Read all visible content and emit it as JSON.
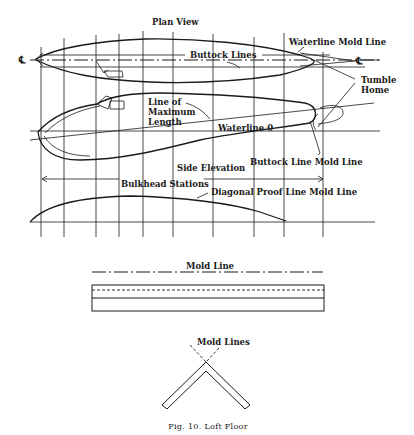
{
  "figure": {
    "caption": "Fig. 10. Loft Floor",
    "caption_prefix": "Fig. 10.",
    "caption_title": "Loft Floor"
  },
  "labels": {
    "plan_view": "Plan View",
    "waterline_mold_line": "Waterline Mold Line",
    "buttock_lines": "Buttock Lines",
    "tumble": "Tumble",
    "home": "Home",
    "line_of": "Line of",
    "maximum": "Maximum",
    "length": "Length",
    "waterline_0": "Waterline 0",
    "side_elevation": "Side Elevation",
    "buttock_line_mold_line": "Buttock Line Mold Line",
    "bulkhead_stations": "Bulkhead Stations",
    "diagonal_proof_line_mold_line": "Diagonal Proof Line Mold Line",
    "mold_line": "Mold Line",
    "mold_lines": "Mold Lines",
    "centerline_symbol_left": "℄",
    "centerline_symbol_right": "℄"
  },
  "stations_x": [
    41,
    64,
    96,
    119,
    143,
    173,
    213,
    254,
    284,
    323
  ],
  "colors": {
    "ink": "#1a1a1a",
    "paper": "#ffffff"
  }
}
